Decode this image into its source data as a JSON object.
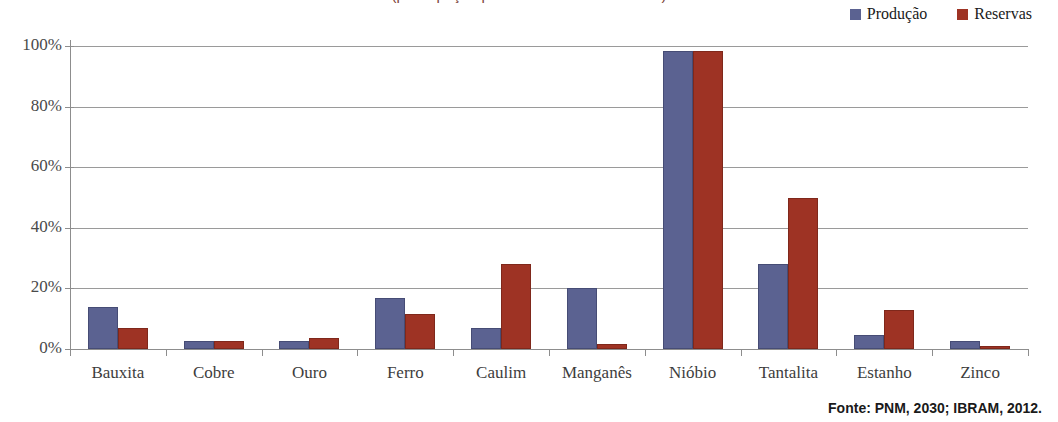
{
  "title": {
    "text": "(participação percentual no total mundial)",
    "visible_note": "clipped at top edge of screenshot",
    "color": "#7b3f37"
  },
  "legend": {
    "position": "top-right",
    "items": [
      {
        "label": "Produção",
        "color": "#5b6291",
        "swatch": "square-swatch"
      },
      {
        "label": "Reservas",
        "color": "#9e3324",
        "swatch": "square-swatch"
      }
    ]
  },
  "axes": {
    "y_ticks": [
      "0%",
      "20%",
      "40%",
      "60%",
      "80%",
      "100%"
    ],
    "x_categories": [
      "Bauxita",
      "Cobre",
      "Ouro",
      "Ferro",
      "Caulim",
      "Manganês",
      "Nióbio",
      "Tantalita",
      "Estanho",
      "Zinco"
    ]
  },
  "source": {
    "text": "Fonte: PNM, 2030; IBRAM, 2012."
  },
  "chart_data": {
    "type": "bar",
    "title": "(participação percentual no total mundial)",
    "xlabel": "",
    "ylabel": "",
    "ylim": [
      0,
      100
    ],
    "ytick_values": [
      0,
      20,
      40,
      60,
      80,
      100
    ],
    "ytick_labels": [
      "0%",
      "20%",
      "40%",
      "60%",
      "80%",
      "100%"
    ],
    "grid": true,
    "legend_position": "top-right",
    "categories": [
      "Bauxita",
      "Cobre",
      "Ouro",
      "Ferro",
      "Caulim",
      "Manganês",
      "Nióbio",
      "Tantalita",
      "Estanho",
      "Zinco"
    ],
    "series": [
      {
        "name": "Produção",
        "color": "#5b6291",
        "values": [
          14,
          2.5,
          2.5,
          17,
          7,
          20,
          98.5,
          28,
          4.5,
          2.5
        ]
      },
      {
        "name": "Reservas",
        "color": "#9e3324",
        "values": [
          7,
          2.5,
          3.5,
          11.5,
          28,
          1.5,
          98.5,
          50,
          13,
          1
        ]
      }
    ]
  }
}
